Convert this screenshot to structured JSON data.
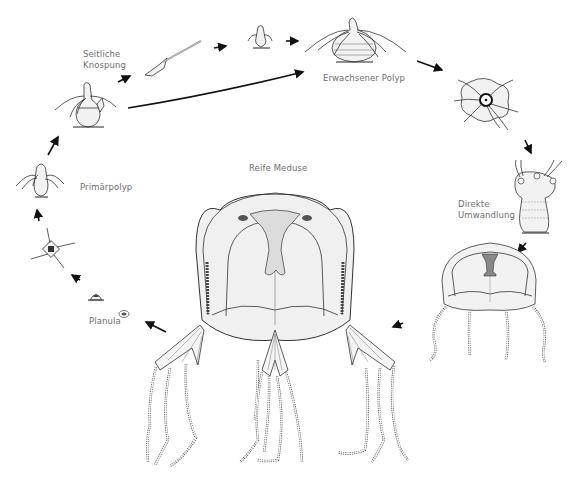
{
  "figure": {
    "labels": {
      "seitliche_knospung_line1": "Seitliche",
      "seitliche_knospung_line2": "Knospung",
      "erwachsener_polyp": "Erwachsener Polyp",
      "primaerpolyp": "Primärpolyp",
      "planula": "Planula",
      "reife_meduse": "Reife Meduse",
      "direkte_umwandlung_line1": "Direkte",
      "direkte_umwandlung_line2": "Umwandlung"
    },
    "colors": {
      "ink": "#333333",
      "label_text": "#6e6e6e",
      "arrow": "#111111",
      "background": "#ffffff"
    },
    "stages": [
      "Planula",
      "Settled planula",
      "Primärpolyp",
      "Polyp with lateral bud",
      "Detached bud",
      "Small polyp",
      "Erwachsener Polyp",
      "Metamorphosing polyp (top view)",
      "Metamorphosing polyp (side view)",
      "Young medusa",
      "Reife Meduse"
    ]
  }
}
